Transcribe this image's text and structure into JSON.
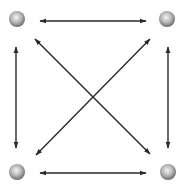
{
  "diagram": {
    "type": "fully-connected-4-node",
    "node_style": {
      "fill_light": "#f2f2f2",
      "fill_dark": "#707070",
      "radius": 8
    },
    "edge_color": "#2a2a2a",
    "nodes": [
      {
        "id": "top-left",
        "cx": 17,
        "cy": 19
      },
      {
        "id": "top-right",
        "cx": 167,
        "cy": 19
      },
      {
        "id": "bottom-left",
        "cx": 17,
        "cy": 172
      },
      {
        "id": "bottom-right",
        "cx": 168,
        "cy": 172
      }
    ],
    "edges": [
      {
        "id": "top",
        "from": "top-left",
        "to": "top-right",
        "bidirectional": true
      },
      {
        "id": "bottom",
        "from": "bottom-left",
        "to": "bottom-right",
        "bidirectional": true
      },
      {
        "id": "left",
        "from": "top-left",
        "to": "bottom-left",
        "bidirectional": true
      },
      {
        "id": "right",
        "from": "top-right",
        "to": "bottom-right",
        "bidirectional": true
      },
      {
        "id": "diag-main",
        "from": "top-left",
        "to": "bottom-right",
        "bidirectional": true
      },
      {
        "id": "diag-anti",
        "from": "top-right",
        "to": "bottom-left",
        "bidirectional": true
      }
    ]
  }
}
